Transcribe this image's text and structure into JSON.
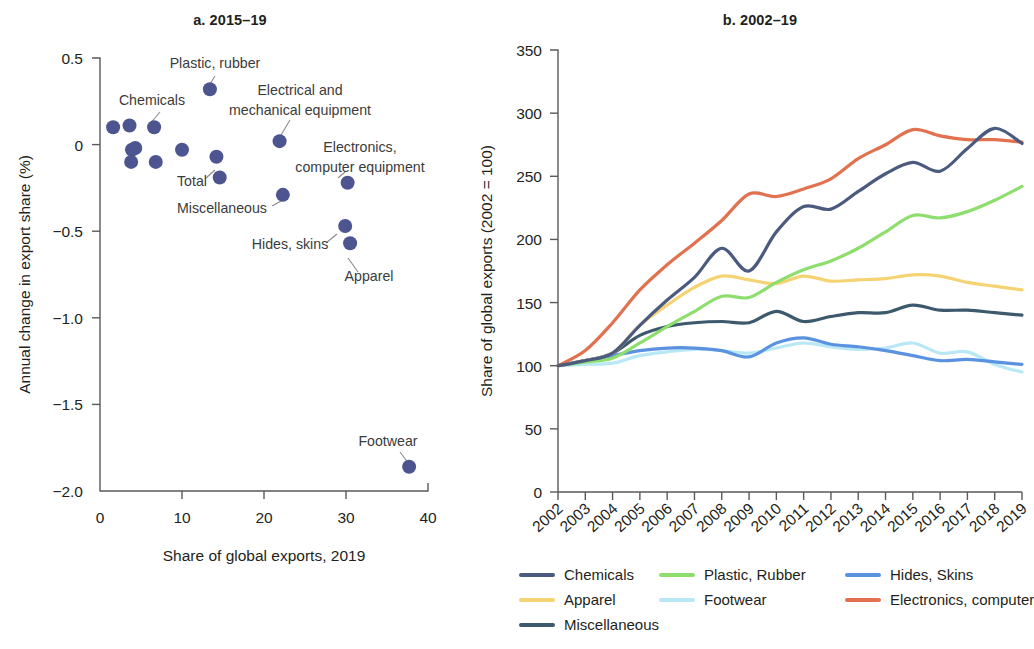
{
  "figure": {
    "panel_a_title": "a. 2015–19",
    "panel_b_title": "b. 2002–19"
  },
  "chart_data": [
    {
      "type": "scatter",
      "panel": "a",
      "title": "a. 2015–19",
      "xlabel": "Share of global exports, 2019",
      "ylabel": "Annual change in export share (%)",
      "xlim": [
        0,
        40
      ],
      "ylim": [
        -2.0,
        0.5
      ],
      "xticks": [
        0,
        10,
        20,
        30,
        40
      ],
      "xtick_labels": [
        "0",
        "10",
        "20",
        "30",
        "40"
      ],
      "yticks": [
        0.5,
        0,
        -0.5,
        -1.0,
        -1.5,
        -2.0
      ],
      "ytick_labels": [
        "0.5",
        "0",
        "−0.5",
        "−1.0",
        "−1.5",
        "−2.0"
      ],
      "grid": false,
      "marker_color": "#4c558f",
      "marker_size": 11,
      "points": [
        {
          "label": "",
          "x": 1.6,
          "y": 0.1
        },
        {
          "label": "",
          "x": 3.6,
          "y": 0.11
        },
        {
          "label": "",
          "x": 3.9,
          "y": -0.03
        },
        {
          "label": "",
          "x": 4.3,
          "y": -0.02
        },
        {
          "label": "",
          "x": 3.8,
          "y": -0.1
        },
        {
          "label": "Chemicals",
          "x": 6.6,
          "y": 0.1
        },
        {
          "label": "",
          "x": 6.8,
          "y": -0.1
        },
        {
          "label": "",
          "x": 10.0,
          "y": -0.03
        },
        {
          "label": "Total",
          "x": 14.2,
          "y": -0.07
        },
        {
          "label": "",
          "x": 14.6,
          "y": -0.19
        },
        {
          "label": "Plastic, rubber",
          "x": 13.4,
          "y": 0.32
        },
        {
          "label": "Miscellaneous",
          "x": 22.3,
          "y": -0.29
        },
        {
          "label": "Electrical and mechanical equipment",
          "x": 21.9,
          "y": 0.02
        },
        {
          "label": "Electronics, computer equipment",
          "x": 30.2,
          "y": -0.22
        },
        {
          "label": "Hides, skins",
          "x": 29.9,
          "y": -0.47
        },
        {
          "label": "Apparel",
          "x": 30.5,
          "y": -0.57
        },
        {
          "label": "Footwear",
          "x": 37.7,
          "y": -1.86
        }
      ],
      "annotations": [
        "Plastic, rubber",
        "Chemicals",
        "Electrical and mechanical equipment",
        "Electronics, computer equipment",
        "Total",
        "Miscellaneous",
        "Hides, skins",
        "Apparel",
        "Footwear"
      ]
    },
    {
      "type": "line",
      "panel": "b",
      "title": "b. 2002–19",
      "xlabel": "",
      "ylabel": "Share of global exports (2002 = 100)",
      "xlim": [
        2002,
        2019
      ],
      "ylim": [
        0,
        350
      ],
      "yticks": [
        0,
        50,
        100,
        150,
        200,
        250,
        300,
        350
      ],
      "ytick_labels": [
        "0",
        "50",
        "100",
        "150",
        "200",
        "250",
        "300",
        "350"
      ],
      "grid": false,
      "legend_position": "bottom",
      "x": [
        2002,
        2003,
        2004,
        2005,
        2006,
        2007,
        2008,
        2009,
        2010,
        2011,
        2012,
        2013,
        2014,
        2015,
        2016,
        2017,
        2018,
        2019
      ],
      "categories": [
        "2002",
        "2003",
        "2004",
        "2005",
        "2006",
        "2007",
        "2008",
        "2009",
        "2010",
        "2011",
        "2012",
        "2013",
        "2014",
        "2015",
        "2016",
        "2017",
        "2018",
        "2019"
      ],
      "series": [
        {
          "name": "Chemicals",
          "color": "#4b5b80",
          "values": [
            100,
            104,
            110,
            132,
            152,
            170,
            193,
            175,
            206,
            226,
            224,
            238,
            252,
            261,
            254,
            272,
            288,
            276
          ]
        },
        {
          "name": "Plastic, Rubber",
          "color": "#8ede6e",
          "values": [
            100,
            103,
            106,
            118,
            131,
            143,
            155,
            154,
            166,
            176,
            183,
            193,
            206,
            219,
            217,
            222,
            231,
            242
          ]
        },
        {
          "name": "Hides, Skins",
          "color": "#5b92e0",
          "values": [
            100,
            104,
            108,
            112,
            114,
            114,
            112,
            107,
            118,
            122,
            117,
            115,
            112,
            108,
            104,
            105,
            103,
            101
          ]
        },
        {
          "name": "Apparel",
          "color": "#f6d372",
          "values": [
            100,
            104,
            110,
            132,
            148,
            162,
            171,
            168,
            165,
            171,
            167,
            168,
            169,
            172,
            171,
            166,
            163,
            160
          ]
        },
        {
          "name": "Footwear",
          "color": "#b8e8f5",
          "values": [
            100,
            101,
            102,
            108,
            111,
            113,
            112,
            110,
            114,
            118,
            115,
            113,
            114,
            118,
            110,
            111,
            101,
            95
          ]
        },
        {
          "name": "Electronics, computer",
          "color": "#e2714f",
          "values": [
            100,
            112,
            134,
            160,
            180,
            197,
            215,
            236,
            234,
            240,
            248,
            264,
            275,
            287,
            282,
            279,
            279,
            277
          ]
        },
        {
          "name": "Miscellaneous",
          "color": "#3d5a6c",
          "values": [
            100,
            104,
            110,
            124,
            131,
            134,
            135,
            134,
            143,
            135,
            139,
            142,
            142,
            148,
            144,
            144,
            142,
            140
          ]
        }
      ]
    }
  ],
  "legend": {
    "rows": [
      [
        {
          "label": "Chemicals",
          "color": "#4b5b80"
        },
        {
          "label": "Plastic, Rubber",
          "color": "#8ede6e"
        },
        {
          "label": "Hides, Skins",
          "color": "#5b92e0"
        }
      ],
      [
        {
          "label": "Apparel",
          "color": "#f6d372"
        },
        {
          "label": "Footwear",
          "color": "#b8e8f5"
        },
        {
          "label": "Electronics, computer",
          "color": "#e2714f"
        }
      ],
      [
        {
          "label": "Miscellaneous",
          "color": "#3d5a6c"
        }
      ]
    ]
  }
}
